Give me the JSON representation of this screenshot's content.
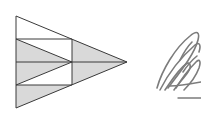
{
  "diagram": {
    "colors": {
      "background": "#ffffff",
      "stroke": "#3a3a3a",
      "fill_shaded": "#d9d9d9",
      "fill_unshaded": "#ffffff",
      "scribble": "#6e6e6e"
    },
    "points": {
      "top_left": [
        16,
        16
      ],
      "tip": [
        127,
        62
      ],
      "bottom_left": [
        16,
        108
      ],
      "upper_left": [
        16,
        39
      ],
      "mid_left": [
        16,
        62
      ],
      "lower_left": [
        16,
        85
      ],
      "upper_mid": [
        72,
        39
      ],
      "center": [
        72,
        62
      ],
      "lower_mid": [
        72,
        85
      ]
    },
    "regions": [
      {
        "name": "top-triangle",
        "points": [
          [
            16,
            16
          ],
          [
            72,
            39
          ],
          [
            16,
            39
          ]
        ],
        "shaded": false
      },
      {
        "name": "upper-inner-triangle",
        "points": [
          [
            16,
            39
          ],
          [
            72,
            39
          ],
          [
            72,
            62
          ]
        ],
        "shaded": false
      },
      {
        "name": "upper-shaded-triangle",
        "points": [
          [
            16,
            39
          ],
          [
            72,
            62
          ],
          [
            16,
            62
          ]
        ],
        "shaded": true
      },
      {
        "name": "lower-shaded-triangle",
        "points": [
          [
            16,
            62
          ],
          [
            72,
            62
          ],
          [
            16,
            85
          ]
        ],
        "shaded": true
      },
      {
        "name": "lower-inner-triangle",
        "points": [
          [
            72,
            62
          ],
          [
            72,
            85
          ],
          [
            16,
            85
          ]
        ],
        "shaded": false
      },
      {
        "name": "bottom-triangle",
        "points": [
          [
            16,
            85
          ],
          [
            72,
            85
          ],
          [
            16,
            108
          ]
        ],
        "shaded": true
      },
      {
        "name": "right-triangle",
        "points": [
          [
            72,
            39
          ],
          [
            127,
            62
          ],
          [
            72,
            85
          ]
        ],
        "shaded": true
      }
    ],
    "scribble_label": "handwritten signature"
  }
}
